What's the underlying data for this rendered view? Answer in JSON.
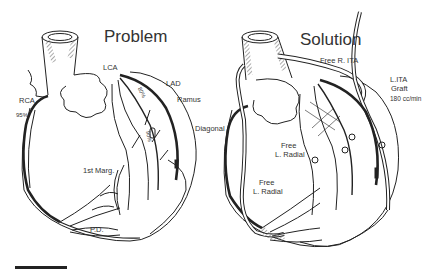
{
  "panels": {
    "problem": {
      "title": "Problem",
      "labels": {
        "lca": "LCA",
        "lad": "LAD",
        "ramus": "Ramus",
        "diagonal": "Diagonal",
        "rca": "RCA",
        "rca_stenosis": "95%",
        "lad_stenosis": "80%",
        "ramus_stenosis": "90%",
        "marginal": "1st Marg.",
        "pd": "P.D."
      }
    },
    "solution": {
      "title": "Solution",
      "labels": {
        "free_r_ita": "Free R. ITA",
        "lita_graft": "L.ITA",
        "lita_graft2": "Graft",
        "flow": "180 cc/min",
        "free_l_radial_1a": "Free",
        "free_l_radial_1b": "L. Radial",
        "free_l_radial_2a": "Free",
        "free_l_radial_2b": "L. Radial"
      }
    }
  },
  "colors": {
    "ink": "#222222",
    "background": "#ffffff",
    "hatch": "#555555"
  }
}
